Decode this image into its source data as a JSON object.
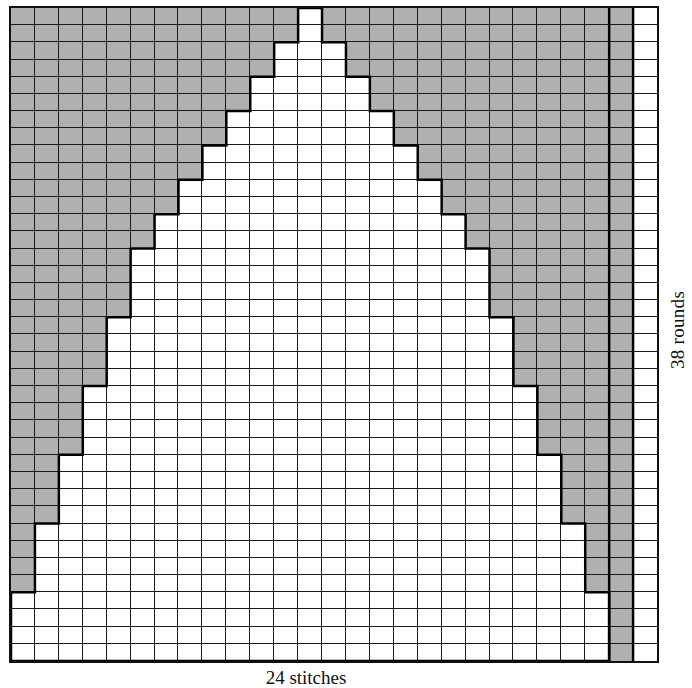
{
  "diagram": {
    "type": "knitting-chart",
    "side_label": "38 rounds",
    "bottom_label": "24 stitches",
    "rows": 38,
    "columns": 27,
    "colors": {
      "shaded": "#a9a9a9",
      "unshaded": "#ffffff",
      "grid_line": "#1a1a1a"
    },
    "legend_note": "Shaded squares = background color; white squares = triangle motif",
    "row_shaded_left_counts": [
      12,
      12,
      11,
      11,
      10,
      10,
      9,
      9,
      8,
      8,
      7,
      7,
      6,
      6,
      5,
      5,
      5,
      5,
      4,
      4,
      4,
      4,
      3,
      3,
      3,
      3,
      2,
      2,
      2,
      2,
      1,
      1,
      1,
      1,
      0,
      0,
      0,
      0
    ],
    "triangle_center_column": 12,
    "triangle_span_columns": 25,
    "extra_columns": [
      {
        "index": 25,
        "state": "shaded",
        "note": "always shaded"
      },
      {
        "index": 26,
        "state": "unshaded",
        "note": "always white"
      }
    ]
  },
  "chart_data": {
    "type": "heatmap",
    "title": "",
    "xlabel": "24 stitches",
    "ylabel": "38 rounds",
    "rows": 38,
    "columns": 27,
    "rule": "row r: columns [s, 24 - s] white, col 25 shaded, col 26 white, others shaded; s = row_shaded_left_counts[r]"
  }
}
